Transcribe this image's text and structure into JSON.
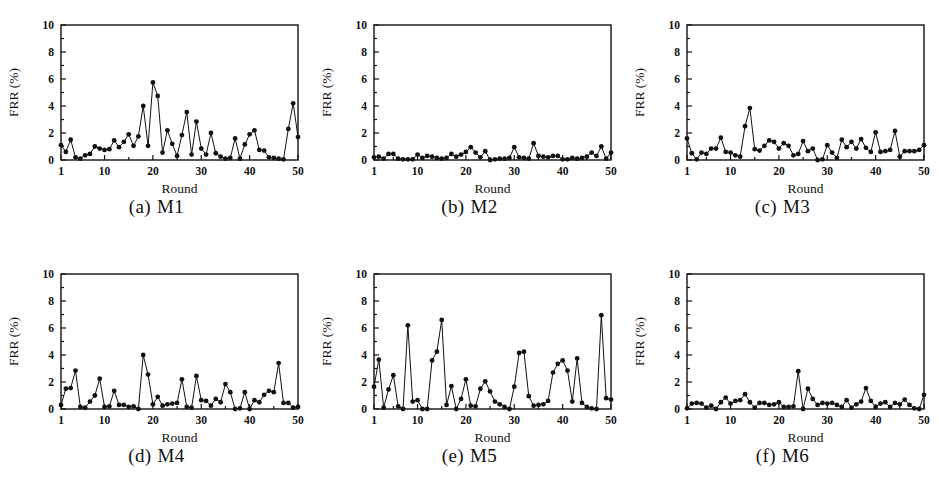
{
  "figure": {
    "panel_count": 6,
    "background": "#ffffff",
    "ink_color": "#111111"
  },
  "axis": {
    "ylabel": "FRR (%)",
    "xlabel": "Round",
    "yticks": [
      0,
      2,
      4,
      6,
      8,
      10
    ],
    "ytick_labels": [
      "0",
      "2",
      "4",
      "6",
      "8",
      "10"
    ],
    "xticks": [
      1,
      10,
      20,
      30,
      40,
      50
    ],
    "xtick_labels": [
      "1",
      "10",
      "20",
      "30",
      "40",
      "50"
    ],
    "ylim": [
      0,
      10
    ],
    "xlim": [
      1,
      50
    ]
  },
  "panels": [
    {
      "index": "(a)",
      "name": "M1"
    },
    {
      "index": "(b)",
      "name": "M2"
    },
    {
      "index": "(c)",
      "name": "M3"
    },
    {
      "index": "(d)",
      "name": "M4"
    },
    {
      "index": "(e)",
      "name": "M5"
    },
    {
      "index": "(f)",
      "name": "M6"
    }
  ],
  "chart_data": [
    {
      "type": "line",
      "panel": "(a) M1",
      "title": "M1",
      "xlabel": "Round",
      "ylabel": "FRR (%)",
      "xlim": [
        1,
        50
      ],
      "ylim": [
        0,
        10
      ],
      "grid": false,
      "legend": "none",
      "marker": "filled-circle",
      "x": [
        1,
        2,
        3,
        4,
        5,
        6,
        7,
        8,
        9,
        10,
        11,
        12,
        13,
        14,
        15,
        16,
        17,
        18,
        19,
        20,
        21,
        22,
        23,
        24,
        25,
        26,
        27,
        28,
        29,
        30,
        31,
        32,
        33,
        34,
        35,
        36,
        37,
        38,
        39,
        40,
        41,
        42,
        43,
        44,
        45,
        46,
        47,
        48,
        49,
        50
      ],
      "values": [
        1.1,
        0.6,
        1.5,
        0.2,
        0.1,
        0.35,
        0.45,
        1.0,
        0.85,
        0.75,
        0.8,
        1.45,
        0.95,
        1.35,
        1.9,
        1.05,
        1.75,
        4.0,
        1.05,
        5.75,
        4.75,
        0.55,
        2.2,
        1.2,
        0.3,
        1.85,
        3.55,
        0.4,
        2.85,
        0.85,
        0.4,
        2.0,
        0.5,
        0.25,
        0.1,
        0.15,
        1.6,
        0.1,
        1.15,
        1.9,
        2.2,
        0.75,
        0.7,
        0.2,
        0.15,
        0.1,
        0.05,
        2.3,
        4.2,
        1.7
      ]
    },
    {
      "type": "line",
      "panel": "(b) M2",
      "title": "M2",
      "xlabel": "Round",
      "ylabel": "FRR (%)",
      "xlim": [
        1,
        50
      ],
      "ylim": [
        0,
        10
      ],
      "grid": false,
      "legend": "none",
      "marker": "filled-circle",
      "x": [
        1,
        2,
        3,
        4,
        5,
        6,
        7,
        8,
        9,
        10,
        11,
        12,
        13,
        14,
        15,
        16,
        17,
        18,
        19,
        20,
        21,
        22,
        23,
        24,
        25,
        26,
        27,
        28,
        29,
        30,
        31,
        32,
        33,
        34,
        35,
        36,
        37,
        38,
        39,
        40,
        41,
        42,
        43,
        44,
        45,
        46,
        47,
        48,
        49,
        50
      ],
      "values": [
        0.2,
        0.25,
        0.1,
        0.45,
        0.45,
        0.1,
        0.05,
        0.05,
        0.05,
        0.4,
        0.15,
        0.3,
        0.25,
        0.15,
        0.1,
        0.15,
        0.45,
        0.25,
        0.4,
        0.6,
        0.95,
        0.55,
        0.2,
        0.65,
        0.0,
        0.05,
        0.1,
        0.1,
        0.15,
        0.95,
        0.2,
        0.15,
        0.1,
        1.25,
        0.3,
        0.25,
        0.2,
        0.3,
        0.3,
        0.05,
        0.05,
        0.15,
        0.1,
        0.15,
        0.25,
        0.55,
        0.3,
        1.0,
        0.1,
        0.55
      ]
    },
    {
      "type": "line",
      "panel": "(c) M3",
      "title": "M3",
      "xlabel": "Round",
      "ylabel": "FRR (%)",
      "xlim": [
        1,
        50
      ],
      "ylim": [
        0,
        10
      ],
      "grid": false,
      "legend": "none",
      "marker": "filled-circle",
      "x": [
        1,
        2,
        3,
        4,
        5,
        6,
        7,
        8,
        9,
        10,
        11,
        12,
        13,
        14,
        15,
        16,
        17,
        18,
        19,
        20,
        21,
        22,
        23,
        24,
        25,
        26,
        27,
        28,
        29,
        30,
        31,
        32,
        33,
        34,
        35,
        36,
        37,
        38,
        39,
        40,
        41,
        42,
        43,
        44,
        45,
        46,
        47,
        48,
        49,
        50
      ],
      "values": [
        1.6,
        0.5,
        0.05,
        0.55,
        0.45,
        0.85,
        0.85,
        1.65,
        0.6,
        0.55,
        0.35,
        0.25,
        2.5,
        3.85,
        0.8,
        0.7,
        1.05,
        1.45,
        1.35,
        0.85,
        1.25,
        1.05,
        0.35,
        0.45,
        1.4,
        0.65,
        0.85,
        0.0,
        0.05,
        1.1,
        0.55,
        0.15,
        1.5,
        0.95,
        1.35,
        0.85,
        1.55,
        0.9,
        0.6,
        2.05,
        0.6,
        0.65,
        0.75,
        2.15,
        0.25,
        0.65,
        0.65,
        0.65,
        0.75,
        1.1
      ]
    },
    {
      "type": "line",
      "panel": "(d) M4",
      "title": "M4",
      "xlabel": "Round",
      "ylabel": "FRR (%)",
      "xlim": [
        1,
        50
      ],
      "ylim": [
        0,
        10
      ],
      "grid": false,
      "legend": "none",
      "marker": "filled-circle",
      "x": [
        1,
        2,
        3,
        4,
        5,
        6,
        7,
        8,
        9,
        10,
        11,
        12,
        13,
        14,
        15,
        16,
        17,
        18,
        19,
        20,
        21,
        22,
        23,
        24,
        25,
        26,
        27,
        28,
        29,
        30,
        31,
        32,
        33,
        34,
        35,
        36,
        37,
        38,
        39,
        40,
        41,
        42,
        43,
        44,
        45,
        46,
        47,
        48,
        49,
        50
      ],
      "values": [
        0.3,
        1.5,
        1.55,
        2.85,
        0.15,
        0.1,
        0.55,
        1.0,
        2.25,
        0.15,
        0.2,
        1.35,
        0.3,
        0.3,
        0.15,
        0.2,
        0.0,
        4.0,
        2.55,
        0.35,
        0.9,
        0.25,
        0.35,
        0.4,
        0.45,
        2.2,
        0.15,
        0.1,
        2.45,
        0.65,
        0.6,
        0.25,
        0.75,
        0.5,
        1.85,
        1.25,
        0.0,
        0.05,
        1.25,
        0.0,
        0.65,
        0.5,
        1.05,
        1.35,
        1.25,
        3.4,
        0.45,
        0.45,
        0.1,
        0.15
      ]
    },
    {
      "type": "line",
      "panel": "(e) M5",
      "title": "M5",
      "xlabel": "Round",
      "ylabel": "FRR (%)",
      "xlim": [
        1,
        50
      ],
      "ylim": [
        0,
        10
      ],
      "grid": false,
      "legend": "none",
      "marker": "filled-circle",
      "x": [
        1,
        2,
        3,
        4,
        5,
        6,
        7,
        8,
        9,
        10,
        11,
        12,
        13,
        14,
        15,
        16,
        17,
        18,
        19,
        20,
        21,
        22,
        23,
        24,
        25,
        26,
        27,
        28,
        29,
        30,
        31,
        32,
        33,
        34,
        35,
        36,
        37,
        38,
        39,
        40,
        41,
        42,
        43,
        44,
        45,
        46,
        47,
        48,
        49,
        50
      ],
      "values": [
        1.65,
        3.65,
        0.1,
        1.45,
        2.5,
        0.2,
        0.0,
        6.2,
        0.55,
        0.65,
        0.0,
        0.0,
        3.6,
        4.25,
        6.6,
        0.3,
        1.7,
        0.0,
        0.75,
        2.2,
        0.25,
        0.2,
        1.5,
        2.05,
        1.3,
        0.55,
        0.35,
        0.15,
        0.0,
        1.65,
        4.15,
        4.25,
        0.95,
        0.25,
        0.3,
        0.35,
        0.6,
        2.7,
        3.35,
        3.6,
        2.85,
        0.55,
        3.75,
        0.45,
        0.15,
        0.05,
        0.0,
        6.95,
        0.8,
        0.7
      ]
    },
    {
      "type": "line",
      "panel": "(f) M6",
      "title": "M6",
      "xlabel": "Round",
      "ylabel": "FRR (%)",
      "xlim": [
        1,
        50
      ],
      "ylim": [
        0,
        10
      ],
      "grid": false,
      "legend": "none",
      "marker": "filled-circle",
      "x": [
        1,
        2,
        3,
        4,
        5,
        6,
        7,
        8,
        9,
        10,
        11,
        12,
        13,
        14,
        15,
        16,
        17,
        18,
        19,
        20,
        21,
        22,
        23,
        24,
        25,
        26,
        27,
        28,
        29,
        30,
        31,
        32,
        33,
        34,
        35,
        36,
        37,
        38,
        39,
        40,
        41,
        42,
        43,
        44,
        45,
        46,
        47,
        48,
        49,
        50
      ],
      "values": [
        0.05,
        0.4,
        0.45,
        0.4,
        0.1,
        0.25,
        0.0,
        0.5,
        0.85,
        0.4,
        0.6,
        0.65,
        1.1,
        0.5,
        0.1,
        0.45,
        0.45,
        0.3,
        0.35,
        0.5,
        0.15,
        0.15,
        0.2,
        2.8,
        0.0,
        1.5,
        0.75,
        0.3,
        0.45,
        0.4,
        0.45,
        0.3,
        0.15,
        0.65,
        0.1,
        0.35,
        0.55,
        1.55,
        0.6,
        0.15,
        0.4,
        0.5,
        0.15,
        0.45,
        0.35,
        0.7,
        0.3,
        0.05,
        0.0,
        1.05
      ]
    }
  ]
}
